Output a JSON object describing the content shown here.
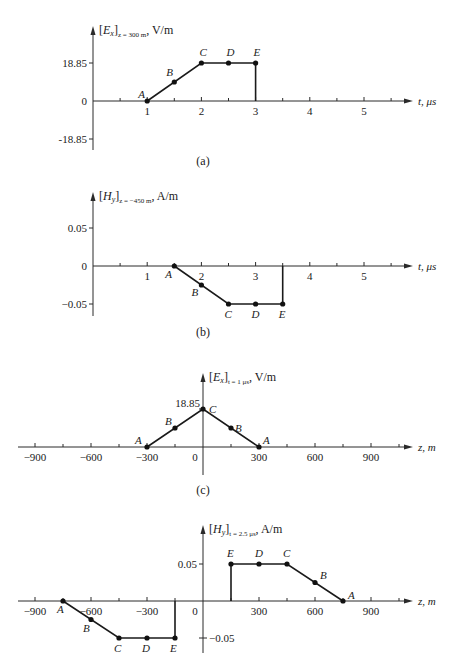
{
  "chart_data": [
    {
      "id": "a",
      "type": "line",
      "caption": "(a)",
      "title": "[Ex]z = 300 m, V/m",
      "ylabel_main": "[E",
      "ylabel_sub_var": "x",
      "ylabel_bracket": "]",
      "ylabel_sub": "z = 300 m",
      "ylabel_unit": ", V/m",
      "xlabel": "t, μs",
      "xlim": [
        0,
        5.8
      ],
      "ylim": [
        -18.85,
        18.85
      ],
      "xticks": [
        1,
        2,
        3,
        4,
        5
      ],
      "xtick_labels": [
        "1",
        "2",
        "3",
        "4",
        "5"
      ],
      "xminor": [
        0.5,
        1.5,
        2.5,
        3.5,
        4.5,
        5.5
      ],
      "yticks": [
        18.85,
        0,
        -18.85
      ],
      "ytick_labels": [
        "18.85",
        "0",
        "-18.85"
      ],
      "points": [
        {
          "label": "A",
          "x": 1,
          "y": 0
        },
        {
          "label": "B",
          "x": 1.5,
          "y": 9.425
        },
        {
          "label": "C",
          "x": 2,
          "y": 18.85
        },
        {
          "label": "D",
          "x": 2.5,
          "y": 18.85
        },
        {
          "label": "E",
          "x": 3,
          "y": 18.85
        }
      ],
      "polyline": [
        [
          1,
          0
        ],
        [
          2,
          18.85
        ],
        [
          3,
          18.85
        ],
        [
          3,
          0
        ]
      ]
    },
    {
      "id": "b",
      "type": "line",
      "caption": "(b)",
      "title": "[Hy]z = -450 m, A/m",
      "ylabel_main": "[H",
      "ylabel_sub_var": "y",
      "ylabel_bracket": "]",
      "ylabel_sub": "z = −450 m",
      "ylabel_unit": ", A/m",
      "xlabel": "t, μs",
      "xlim": [
        0,
        5.8
      ],
      "ylim": [
        -0.05,
        0.05
      ],
      "xticks": [
        1,
        2,
        3,
        4,
        5
      ],
      "xtick_labels": [
        "1",
        "2",
        "3",
        "4",
        "5"
      ],
      "xminor": [
        0.5,
        1.5,
        2.5,
        3.5,
        4.5,
        5.5
      ],
      "yticks": [
        0.05,
        0,
        -0.05
      ],
      "ytick_labels": [
        "0.05",
        "0",
        "−0.05"
      ],
      "points": [
        {
          "label": "A",
          "x": 1.5,
          "y": 0
        },
        {
          "label": "B",
          "x": 2,
          "y": -0.025
        },
        {
          "label": "C",
          "x": 2.5,
          "y": -0.05
        },
        {
          "label": "D",
          "x": 3,
          "y": -0.05
        },
        {
          "label": "E",
          "x": 3.5,
          "y": -0.05
        }
      ],
      "polyline": [
        [
          1.5,
          0
        ],
        [
          2.5,
          -0.05
        ],
        [
          3.5,
          -0.05
        ],
        [
          3.5,
          0
        ]
      ]
    },
    {
      "id": "c",
      "type": "line",
      "caption": "(c)",
      "title": "[Ex]t = 1 μs, V/m",
      "ylabel_main": "[E",
      "ylabel_sub_var": "x",
      "ylabel_bracket": "]",
      "ylabel_sub": "t = 1 μs",
      "ylabel_unit": ", V/m",
      "xlabel": "z, m",
      "xlim": [
        -1000,
        1100
      ],
      "ylim": [
        0,
        18.85
      ],
      "xticks": [
        -900,
        -600,
        -300,
        0,
        300,
        600,
        900
      ],
      "xtick_labels": [
        "−900",
        "−600",
        "−300",
        "0",
        "300",
        "600",
        "900"
      ],
      "xminor": [
        -750,
        -450,
        -150,
        150,
        450,
        750,
        1050
      ],
      "yticks": [
        18.85
      ],
      "ytick_labels": [
        "18.85"
      ],
      "points": [
        {
          "label": "A",
          "x": -300,
          "y": 0
        },
        {
          "label": "B",
          "x": -150,
          "y": 9.425
        },
        {
          "label": "C",
          "x": 0,
          "y": 18.85
        },
        {
          "label": "B",
          "x": 150,
          "y": 9.425
        },
        {
          "label": "A",
          "x": 300,
          "y": 0
        }
      ],
      "polyline": [
        [
          -300,
          0
        ],
        [
          0,
          18.85
        ],
        [
          300,
          0
        ]
      ]
    },
    {
      "id": "d",
      "type": "line",
      "caption": "",
      "title": "[Hy]t = 2.5 μs, A/m",
      "ylabel_main": "[H",
      "ylabel_sub_var": "y",
      "ylabel_bracket": "]",
      "ylabel_sub": "t = 2.5 μs",
      "ylabel_unit": ", A/m",
      "xlabel": "z, m",
      "xlim": [
        -1000,
        1100
      ],
      "ylim": [
        -0.05,
        0.05
      ],
      "xticks": [
        -900,
        -600,
        -300,
        0,
        300,
        600,
        900
      ],
      "xtick_labels": [
        "−900",
        "−600",
        "−300",
        "0",
        "300",
        "600",
        "900"
      ],
      "xminor": [
        -750,
        -450,
        -150,
        150,
        450,
        750,
        1050
      ],
      "yticks": [
        0.05,
        -0.05
      ],
      "ytick_labels": [
        "0.05",
        "−0.05"
      ],
      "points": [
        {
          "label": "A",
          "x": -750,
          "y": 0
        },
        {
          "label": "B",
          "x": -600,
          "y": -0.025
        },
        {
          "label": "C",
          "x": -450,
          "y": -0.05
        },
        {
          "label": "D",
          "x": -300,
          "y": -0.05
        },
        {
          "label": "E",
          "x": -150,
          "y": -0.05
        },
        {
          "label": "E",
          "x": 150,
          "y": 0.05
        },
        {
          "label": "D",
          "x": 300,
          "y": 0.05
        },
        {
          "label": "C",
          "x": 450,
          "y": 0.05
        },
        {
          "label": "B",
          "x": 600,
          "y": 0.025
        },
        {
          "label": "A",
          "x": 750,
          "y": 0
        }
      ],
      "polylines": [
        [
          [
            -750,
            0
          ],
          [
            -450,
            -0.05
          ],
          [
            -150,
            -0.05
          ],
          [
            -150,
            0
          ]
        ],
        [
          [
            150,
            0
          ],
          [
            150,
            0.05
          ],
          [
            450,
            0.05
          ],
          [
            750,
            0
          ]
        ]
      ]
    }
  ]
}
